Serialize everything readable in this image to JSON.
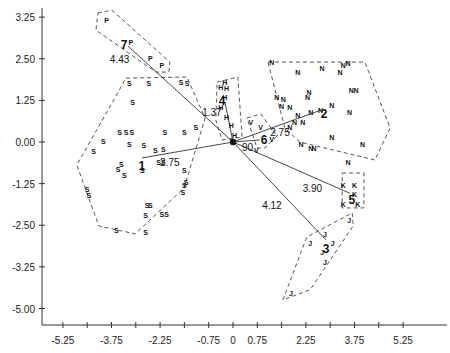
{
  "chart_data": {
    "type": "scatter",
    "title": "",
    "xlabel": "",
    "ylabel": "",
    "x_ticks": [
      {
        "value": -5.25,
        "label": "-5.25"
      },
      {
        "value": -4.5,
        "label": ""
      },
      {
        "value": -3.75,
        "label": "-3.75"
      },
      {
        "value": -3.0,
        "label": ""
      },
      {
        "value": -2.25,
        "label": "-2.25"
      },
      {
        "value": -1.5,
        "label": ""
      },
      {
        "value": -0.75,
        "label": "-0.75"
      },
      {
        "value": 0,
        "label": "0"
      },
      {
        "value": 0.75,
        "label": "0.75"
      },
      {
        "value": 1.5,
        "label": ""
      },
      {
        "value": 2.25,
        "label": "2.25"
      },
      {
        "value": 3.0,
        "label": ""
      },
      {
        "value": 3.75,
        "label": "3.75"
      },
      {
        "value": 4.5,
        "label": ""
      },
      {
        "value": 5.25,
        "label": "5.25"
      }
    ],
    "y_ticks": [
      {
        "value": 3.75,
        "label": "3.25"
      },
      {
        "value": 2.5,
        "label": "2.50"
      },
      {
        "value": 1.25,
        "label": "1.25"
      },
      {
        "value": 0.0,
        "label": "0.00"
      },
      {
        "value": -1.25,
        "label": "-1.25"
      },
      {
        "value": -2.5,
        "label": "-2.50"
      },
      {
        "value": -3.75,
        "label": "-3.25"
      },
      {
        "value": -5.0,
        "label": "-5.00"
      }
    ],
    "xlim": [
      -5.5,
      6.6
    ],
    "ylim": [
      -5.5,
      4.1
    ],
    "grid": false,
    "origin": {
      "x": 0,
      "y": 0
    },
    "groups": [
      {
        "letter": "P",
        "centroid_label": "7",
        "centroid": [
          -3.36,
          2.94
        ],
        "distance_label": "4.43",
        "distance_pos": [
          -3.5,
          2.5
        ],
        "ray": [
          [
            -3.24,
            2.88
          ],
          [
            0,
            0
          ]
        ],
        "points": [
          [
            -3.9,
            3.67
          ],
          [
            -3.15,
            3.0
          ],
          [
            -2.55,
            2.52
          ],
          [
            -2.2,
            2.31
          ]
        ],
        "hull": [
          [
            -4.17,
            3.87
          ],
          [
            -3.74,
            3.96
          ],
          [
            -1.95,
            2.4
          ],
          [
            -1.98,
            2.1
          ],
          [
            -2.38,
            2.1
          ],
          [
            -4.23,
            3.36
          ]
        ]
      },
      {
        "letter": "S",
        "centroid_label": "1",
        "centroid": [
          -2.81,
          -0.69
        ],
        "distance_label": "2.75",
        "distance_pos": [
          -1.95,
          -0.6
        ],
        "ray": [
          [
            -2.81,
            -0.48
          ],
          [
            0,
            0
          ]
        ],
        "points": [
          [
            -3.2,
            1.77
          ],
          [
            -2.6,
            1.77
          ],
          [
            -1.6,
            1.8
          ],
          [
            -1.42,
            1.77
          ],
          [
            -3.1,
            1.2
          ],
          [
            -1.15,
            0.45
          ],
          [
            -3.5,
            0.3
          ],
          [
            -3.3,
            0.3
          ],
          [
            -3.12,
            0.3
          ],
          [
            -2.1,
            0.3
          ],
          [
            -1.5,
            0.3
          ],
          [
            -4.0,
            0.03
          ],
          [
            -3.2,
            -0.06
          ],
          [
            -2.75,
            -0.09
          ],
          [
            -2.4,
            -0.24
          ],
          [
            -2.15,
            -0.2
          ],
          [
            -4.3,
            -0.27
          ],
          [
            -2.3,
            -0.6
          ],
          [
            -2.15,
            -0.6
          ],
          [
            -3.45,
            -0.66
          ],
          [
            -3.55,
            -0.8
          ],
          [
            -3.35,
            -1.0
          ],
          [
            -2.8,
            -0.84
          ],
          [
            -4.5,
            -1.4
          ],
          [
            -4.45,
            -1.6
          ],
          [
            -1.5,
            -0.84
          ],
          [
            -1.45,
            -1.2
          ],
          [
            -1.5,
            -1.3
          ],
          [
            -1.55,
            -1.5
          ],
          [
            -2.65,
            -1.9
          ],
          [
            -2.55,
            -1.9
          ],
          [
            -2.7,
            -2.2
          ],
          [
            -2.2,
            -2.15
          ],
          [
            -2.05,
            -2.15
          ],
          [
            -3.6,
            -2.65
          ],
          [
            -2.7,
            -2.7
          ]
        ],
        "hull": [
          [
            -3.3,
            1.92
          ],
          [
            -1.42,
            1.95
          ],
          [
            -0.86,
            0.72
          ],
          [
            -1.51,
            -1.38
          ],
          [
            -3.02,
            -2.76
          ],
          [
            -4.14,
            -2.52
          ],
          [
            -4.82,
            -0.69
          ]
        ]
      },
      {
        "letter": "H",
        "centroid_label": "4",
        "centroid": [
          -0.34,
          1.26
        ],
        "distance_label": "1.37",
        "distance_pos": [
          -0.65,
          0.9
        ],
        "ray": [
          [
            -0.25,
            1.2
          ],
          [
            0,
            0
          ]
        ],
        "points": [
          [
            -0.38,
            1.65
          ],
          [
            -0.25,
            1.8
          ],
          [
            -0.2,
            1.62
          ],
          [
            -0.25,
            1.35
          ],
          [
            -0.38,
            1.06
          ],
          [
            -0.2,
            0.75
          ],
          [
            -0.05,
            0.5
          ],
          [
            0.05,
            0.2
          ]
        ],
        "hull": [
          [
            -0.49,
            1.8
          ],
          [
            0.15,
            1.95
          ],
          [
            0.28,
            0.15
          ],
          [
            -0.34,
            0.06
          ],
          [
            -0.53,
            0.66
          ]
        ]
      },
      {
        "letter": "V",
        "centroid_label": "6",
        "centroid": [
          0.96,
          0.09
        ],
        "distance_label": "90",
        "distance_pos": [
          0.45,
          -0.15
        ],
        "ray": [
          [
            0.82,
            0.06
          ],
          [
            0,
            0
          ]
        ],
        "points": [
          [
            0.55,
            0.6
          ],
          [
            0.85,
            0.45
          ],
          [
            1.2,
            0.1
          ],
          [
            0.72,
            -0.25
          ]
        ],
        "hull": [
          [
            0.43,
            0.72
          ],
          [
            0.86,
            0.84
          ],
          [
            1.36,
            0.18
          ],
          [
            0.99,
            -0.18
          ],
          [
            0.74,
            -0.18
          ]
        ]
      },
      {
        "letter": "N",
        "centroid_label": "2",
        "centroid": [
          2.81,
          0.87
        ],
        "distance_label": "2.75",
        "distance_pos": [
          1.45,
          0.3
        ],
        "ray": [
          [
            2.72,
            0.96
          ],
          [
            0,
            0
          ]
        ],
        "points": [
          [
            1.2,
            2.4
          ],
          [
            2.0,
            2.1
          ],
          [
            2.75,
            2.22
          ],
          [
            3.3,
            2.1
          ],
          [
            3.4,
            2.3
          ],
          [
            3.55,
            2.38
          ],
          [
            1.35,
            1.35
          ],
          [
            1.75,
            1.05
          ],
          [
            1.5,
            1.07
          ],
          [
            1.55,
            1.3
          ],
          [
            2.35,
            1.5
          ],
          [
            2.3,
            1.35
          ],
          [
            2.4,
            0.9
          ],
          [
            2.7,
            0.95
          ],
          [
            2.0,
            0.8
          ],
          [
            2.15,
            0.6
          ],
          [
            1.9,
            0.6
          ],
          [
            1.75,
            0.45
          ],
          [
            3.05,
            1.1
          ],
          [
            3.65,
            1.55
          ],
          [
            3.8,
            1.55
          ],
          [
            3.6,
            0.9
          ],
          [
            3.05,
            0.15
          ],
          [
            2.1,
            -0.05
          ],
          [
            2.4,
            -0.18
          ],
          [
            2.5,
            -0.18
          ],
          [
            4.0,
            -0.05
          ],
          [
            3.55,
            -0.6
          ]
        ],
        "hull": [
          [
            1.08,
            2.4
          ],
          [
            4.07,
            2.4
          ],
          [
            4.85,
            0.42
          ],
          [
            4.38,
            -0.54
          ],
          [
            2.06,
            0.0
          ],
          [
            1.6,
            0.42
          ]
        ]
      },
      {
        "letter": "K",
        "centroid_label": "5",
        "centroid": [
          3.67,
          -1.71
        ],
        "distance_label": "3.90",
        "distance_pos": [
          2.45,
          -1.38
        ],
        "ray": [
          [
            3.61,
            -1.54
          ],
          [
            0,
            0
          ]
        ],
        "points": [
          [
            3.4,
            -1.3
          ],
          [
            3.75,
            -1.3
          ],
          [
            3.75,
            -1.55
          ],
          [
            3.4,
            -1.85
          ],
          [
            3.85,
            -1.85
          ]
        ],
        "hull": [
          [
            3.37,
            -0.93
          ],
          [
            4.04,
            -0.93
          ],
          [
            4.04,
            -1.98
          ],
          [
            3.37,
            -1.98
          ]
        ]
      },
      {
        "letter": "J",
        "centroid_label": "3",
        "centroid": [
          2.87,
          -3.18
        ],
        "distance_label": "4.12",
        "distance_pos": [
          1.2,
          -1.9
        ],
        "ray": [
          [
            2.87,
            -2.94
          ],
          [
            0,
            0
          ]
        ],
        "points": [
          [
            3.59,
            -2.34
          ],
          [
            2.38,
            -3.03
          ],
          [
            2.84,
            -2.77
          ],
          [
            3.08,
            -3.03
          ],
          [
            2.75,
            -3.3
          ],
          [
            2.84,
            -3.6
          ],
          [
            1.79,
            -4.54
          ]
        ],
        "hull": [
          [
            3.68,
            -2.13
          ],
          [
            3.71,
            -2.52
          ],
          [
            2.38,
            -4.44
          ],
          [
            1.54,
            -4.74
          ],
          [
            2.28,
            -2.85
          ]
        ]
      }
    ]
  }
}
